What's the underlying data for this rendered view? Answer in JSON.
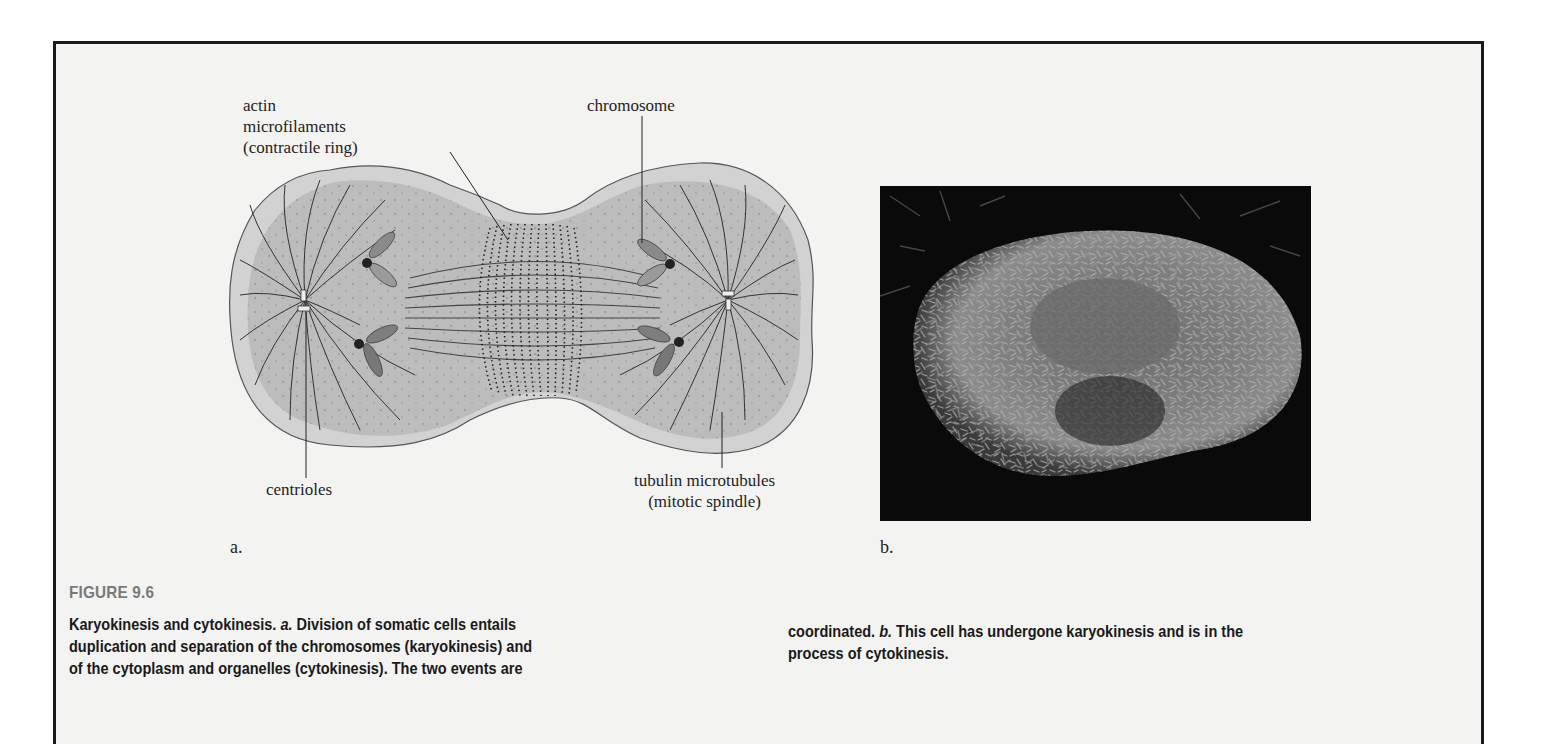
{
  "figure": {
    "number_label": "FIGURE 9.6",
    "panel_a": {
      "letter": "a.",
      "labels": {
        "actin_line1": "actin",
        "actin_line2": "microfilaments",
        "actin_line3": "(contractile ring)",
        "chromosome": "chromosome",
        "centrioles": "centrioles",
        "tubulin_line1": "tubulin microtubules",
        "tubulin_line2": "(mitotic spindle)"
      }
    },
    "panel_b": {
      "letter": "b.",
      "image_description": "scanning electron micrograph of a cell undergoing cytokinesis"
    },
    "caption": {
      "left_line1_pre": "Karyokinesis and cytokinesis. ",
      "left_line1_italic": "a.",
      "left_line1_post": " Division of somatic cells entails",
      "left_line2": "duplication and separation of the chromosomes (karyokinesis) and",
      "left_line3": "of the cytoplasm and organelles (cytokinesis). The two events are",
      "right_line1_pre": "coordinated. ",
      "right_line1_italic": "b.",
      "right_line1_post": " This cell has undergone karyokinesis and is in the",
      "right_line2": "process of cytokinesis."
    }
  }
}
